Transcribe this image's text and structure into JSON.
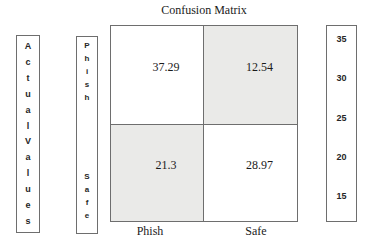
{
  "title": "Confusion Matrix",
  "left_axis": {
    "label": "Actual Values",
    "letters": [
      "A",
      "c",
      "t",
      "u",
      "a",
      "l",
      "V",
      "a",
      "l",
      "u",
      "e",
      "s"
    ]
  },
  "row_axis": {
    "phish_letters": [
      "P",
      "h",
      "i",
      "s",
      "h"
    ],
    "safe_letters": [
      "S",
      "a",
      "f",
      "e"
    ]
  },
  "matrix": {
    "cells": {
      "top_left": "37.29",
      "top_right": "12.54",
      "bottom_left": "21.3",
      "bottom_right": "28.97"
    }
  },
  "x_axis": {
    "labels": [
      "Phish",
      "Safe"
    ]
  },
  "scale": {
    "ticks": [
      "35",
      "30",
      "25",
      "20",
      "15"
    ]
  },
  "colors": {
    "shaded_cell": "#eaeae8",
    "border": "#6e6e6e",
    "background": "#ffffff",
    "text": "#1a1a1a"
  },
  "chart_data": {
    "type": "heatmap",
    "title": "Confusion Matrix",
    "y_axis_title": "Actual Values",
    "rows": [
      "Phish",
      "Safe"
    ],
    "columns": [
      "Phish",
      "Safe"
    ],
    "values": [
      [
        37.29,
        12.54
      ],
      [
        21.3,
        28.97
      ]
    ],
    "shaded_cells": [
      [
        0,
        1
      ],
      [
        1,
        0
      ]
    ],
    "colorbar": {
      "position": "right",
      "ticks": [
        35,
        30,
        25,
        20,
        15
      ]
    },
    "grid": true,
    "legend_position": "right"
  }
}
